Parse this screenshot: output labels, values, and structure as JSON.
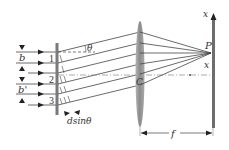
{
  "diagram": {
    "labels": {
      "slit_width_top": "b",
      "slit_width_bottom": "b'",
      "angle": "θ",
      "path_difference": "dsinθ",
      "point": "P",
      "lens_center": "C",
      "x_position": "x",
      "x_axis": "x",
      "focal_length": "f"
    },
    "slit_numbers": [
      "1",
      "2",
      "3"
    ],
    "colors": {
      "line": "#3a3a3a",
      "grating": "#777777",
      "lens": "#9a9a9a",
      "screen": "#6a6a6a",
      "axis": "#888888"
    }
  }
}
